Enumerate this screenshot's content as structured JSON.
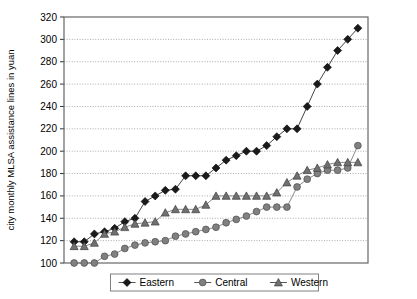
{
  "chart_data": {
    "type": "line",
    "title": "",
    "xlabel": "",
    "ylabel": "city monthly MLSA assistance lines in yuan",
    "ylim": [
      100,
      320
    ],
    "ytick_step": 20,
    "yticks": [
      100,
      120,
      140,
      160,
      180,
      200,
      220,
      240,
      260,
      280,
      300,
      320
    ],
    "grid": true,
    "xticks_labeled": false,
    "n_points": 22,
    "legend_position": "bottom-center",
    "legend": [
      "Eastern",
      "Central",
      "Western"
    ],
    "series": [
      {
        "name": "Eastern",
        "marker": "diamond",
        "color": "#1a1a1a",
        "values": [
          119,
          119,
          126,
          128,
          131,
          137,
          140,
          155,
          160,
          165,
          166,
          178,
          178,
          178,
          185,
          192,
          196,
          200,
          200,
          205,
          213,
          220,
          220,
          240,
          260,
          275,
          290,
          300,
          310
        ]
      },
      {
        "name": "Central",
        "marker": "circle",
        "color": "#808080",
        "values": [
          100,
          100,
          100,
          106,
          108,
          113,
          116,
          118,
          119,
          120,
          124,
          126,
          128,
          130,
          132,
          136,
          139,
          142,
          146,
          150,
          150,
          150,
          168,
          175,
          180,
          183,
          183,
          185,
          205
        ]
      },
      {
        "name": "Western",
        "marker": "triangle",
        "color": "#707070",
        "values": [
          115,
          115,
          118,
          126,
          128,
          132,
          135,
          136,
          137,
          145,
          148,
          148,
          148,
          152,
          160,
          160,
          160,
          160,
          160,
          160,
          163,
          172,
          178,
          183,
          185,
          188,
          190,
          190,
          190
        ]
      }
    ]
  },
  "legend": {
    "items": [
      {
        "label": "Eastern",
        "marker": "diamond"
      },
      {
        "label": "Central",
        "marker": "circle"
      },
      {
        "label": "Western",
        "marker": "triangle"
      }
    ]
  },
  "axis": {
    "y_title": "city monthly MLSA assistance lines in yuan",
    "y_tick_labels": [
      "320",
      "300",
      "280",
      "260",
      "240",
      "220",
      "200",
      "180",
      "160",
      "140",
      "120",
      "100"
    ]
  },
  "colors": {
    "eastern": "#1a1a1a",
    "central": "#808080",
    "western": "#707070",
    "grid": "#aaaaaa",
    "axis": "#555555",
    "background": "#ffffff"
  }
}
